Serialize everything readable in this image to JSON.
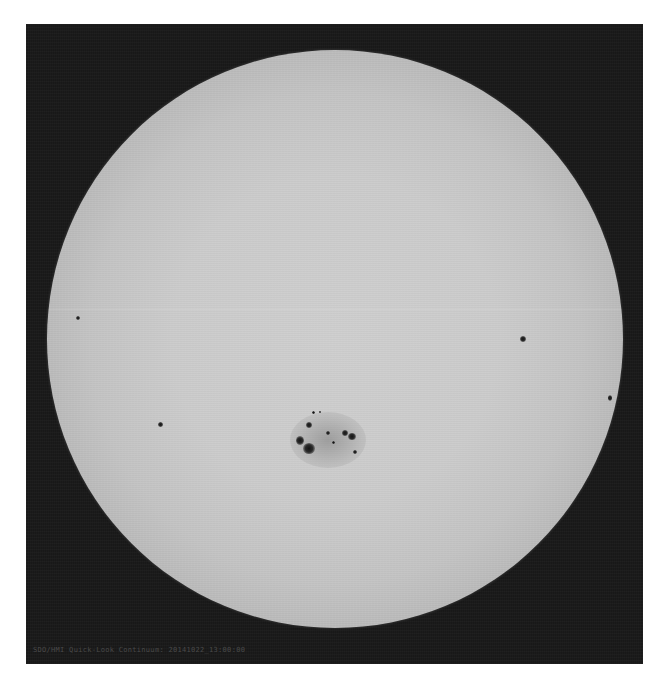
{
  "image": {
    "subject": "Full-disk solar photograph (continuum) showing sunspots",
    "caption": "SDO/HMI Quick-Look Continuum: 20141022_13:00:00",
    "colors": {
      "page_background": "#ffffff",
      "frame_background": "#181818",
      "disk_center": "#cfcfcf",
      "disk_limb": "#505050",
      "umbra": "#151515",
      "caption_text": "#4a4a4a"
    },
    "sun_disk": {
      "center_px": [
        335,
        338
      ],
      "radius_px": 288
    },
    "sunspots": [
      {
        "id": "active-region-main",
        "x": 325,
        "y": 438,
        "w": 70,
        "h": 50,
        "type": "penumbra"
      },
      {
        "id": "umbra-1",
        "x": 309,
        "y": 425,
        "size": 6
      },
      {
        "id": "umbra-2",
        "x": 300,
        "y": 440,
        "size": 8
      },
      {
        "id": "umbra-3",
        "x": 308,
        "y": 449,
        "size": 11
      },
      {
        "id": "umbra-4",
        "x": 328,
        "y": 433,
        "size": 4
      },
      {
        "id": "umbra-5",
        "x": 345,
        "y": 433,
        "size": 6
      },
      {
        "id": "umbra-6",
        "x": 352,
        "y": 437,
        "size": 7
      },
      {
        "id": "umbra-7",
        "x": 355,
        "y": 452,
        "size": 4
      },
      {
        "id": "umbra-8",
        "x": 313,
        "y": 413,
        "size": 3
      },
      {
        "id": "umbra-9",
        "x": 320,
        "y": 412,
        "size": 2
      },
      {
        "id": "spot-west",
        "x": 523,
        "y": 339,
        "size": 6
      },
      {
        "id": "spot-east",
        "x": 78,
        "y": 318,
        "size": 4
      },
      {
        "id": "spot-southeast",
        "x": 160,
        "y": 425,
        "size": 5
      },
      {
        "id": "spot-limb-west",
        "x": 610,
        "y": 398,
        "size": 4
      }
    ]
  }
}
